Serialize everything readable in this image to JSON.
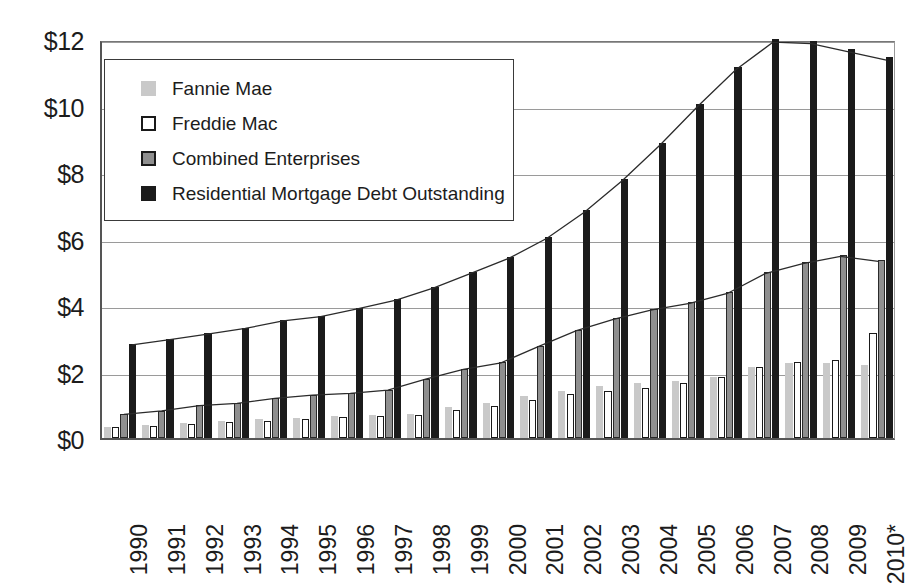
{
  "chart_data": {
    "type": "bar",
    "title": "",
    "subtitle": "",
    "xlabel": "",
    "ylabel": "",
    "ylim": [
      0,
      12
    ],
    "ytick_values": [
      0,
      2,
      4,
      6,
      8,
      10,
      12
    ],
    "ytick_labels": [
      "$0",
      "$2",
      "$4",
      "$6",
      "$8",
      "$10",
      "$12"
    ],
    "grid": true,
    "legend_position": "upper-left-inside",
    "units_note": "Trillions of dollars",
    "categories": [
      "1990",
      "1991",
      "1992",
      "1993",
      "1994",
      "1995",
      "1996",
      "1997",
      "1998",
      "1999",
      "2000",
      "2001",
      "2002",
      "2003",
      "2004",
      "2005",
      "2006",
      "2007",
      "2008",
      "2009",
      "2010*"
    ],
    "series": [
      {
        "name": "Fannie Mae",
        "color": "#c9c9c9",
        "style": "light-gray-fill",
        "values": [
          0.33,
          0.4,
          0.45,
          0.5,
          0.56,
          0.6,
          0.65,
          0.7,
          0.73,
          0.93,
          1.06,
          1.25,
          1.42,
          1.57,
          1.65,
          1.7,
          1.85,
          2.15,
          2.25,
          2.25,
          2.2
        ]
      },
      {
        "name": "Freddie Mac",
        "color": "#ffffff",
        "style": "white-fill-black-outline",
        "values": [
          0.32,
          0.36,
          0.42,
          0.48,
          0.52,
          0.58,
          0.64,
          0.66,
          0.7,
          0.85,
          0.95,
          1.15,
          1.32,
          1.4,
          1.5,
          1.65,
          1.85,
          2.15,
          2.28,
          2.35,
          3.15
        ]
      },
      {
        "name": "Combined Enterprises",
        "color": "#8f8f8f",
        "style": "medium-gray-fill",
        "values": [
          0.72,
          0.82,
          0.98,
          1.05,
          1.2,
          1.3,
          1.35,
          1.45,
          1.78,
          2.08,
          2.28,
          2.78,
          3.25,
          3.6,
          3.88,
          4.08,
          4.38,
          4.98,
          5.28,
          5.5,
          5.35
        ]
      },
      {
        "name": "Residential Mortgage Debt Outstanding",
        "color": "#1b1b1b",
        "style": "black-fill",
        "values": [
          2.82,
          2.98,
          3.15,
          3.32,
          3.55,
          3.68,
          3.92,
          4.18,
          4.55,
          5.0,
          5.45,
          6.05,
          6.85,
          7.8,
          8.88,
          10.05,
          11.15,
          12.0,
          11.95,
          11.7,
          11.45
        ]
      }
    ],
    "trend_lines": [
      {
        "name": "rmdo-envelope",
        "follows_series": "Residential Mortgage Debt Outstanding"
      },
      {
        "name": "combined-envelope",
        "follows_series": "Combined Enterprises"
      }
    ]
  },
  "legend": {
    "items": [
      {
        "label": "Fannie Mae",
        "swatch": "light-gray-square-icon"
      },
      {
        "label": "Freddie Mac",
        "swatch": "white-square-outline-icon"
      },
      {
        "label": "Combined Enterprises",
        "swatch": "gray-square-icon"
      },
      {
        "label": "Residential Mortgage Debt Outstanding",
        "swatch": "black-square-icon"
      }
    ]
  }
}
